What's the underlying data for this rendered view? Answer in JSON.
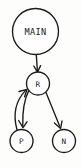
{
  "diagram": {
    "background_color": "#fdfdfc",
    "stroke_color": "#1a1a1a",
    "node_fill_color": "#fefefe",
    "nodes": [
      {
        "id": "main",
        "label": "MAIN",
        "cx": 35.5,
        "cy": 31.5,
        "r": 23.0,
        "size": "large"
      },
      {
        "id": "r",
        "label": "R",
        "cx": 38.0,
        "cy": 83.5,
        "r": 11.5,
        "size": "small"
      },
      {
        "id": "p",
        "label": "P",
        "cx": 21.5,
        "cy": 141.0,
        "r": 11.5,
        "size": "small"
      },
      {
        "id": "n",
        "label": "N",
        "cx": 64.0,
        "cy": 141.0,
        "r": 11.5,
        "size": "small"
      }
    ],
    "edges": [
      {
        "id": "main-to-r",
        "from": "MAIN",
        "to": "R",
        "shape": "straight",
        "directed": true
      },
      {
        "id": "r-to-p",
        "from": "R",
        "to": "P",
        "shape": "curved",
        "directed": true
      },
      {
        "id": "p-to-r",
        "from": "P",
        "to": "R",
        "shape": "curved",
        "directed": true
      },
      {
        "id": "r-to-n",
        "from": "R",
        "to": "N",
        "shape": "straight",
        "directed": true
      }
    ]
  }
}
